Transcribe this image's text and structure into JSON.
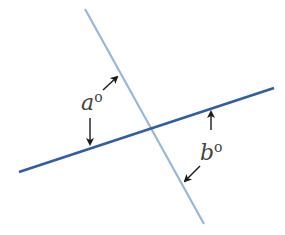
{
  "diagram": {
    "type": "intersecting-lines-angles",
    "colors": {
      "line_light": "#9ab7d6",
      "line_dark": "#2f5fa3",
      "arrow": "#1a1a1a",
      "text": "#444444",
      "background": "#ffffff"
    },
    "lines": [
      {
        "name": "steep-line",
        "x1": 85,
        "y1": 9,
        "x2": 204,
        "y2": 224
      },
      {
        "name": "shallow-line",
        "x1": 19,
        "y1": 172,
        "x2": 274,
        "y2": 88
      }
    ],
    "labels": {
      "a": {
        "letter": "a",
        "degree": "o"
      },
      "b": {
        "letter": "b",
        "degree": "o"
      }
    }
  }
}
